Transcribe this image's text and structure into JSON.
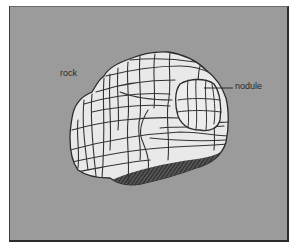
{
  "figure": {
    "background_color": "#9b9b9b",
    "rock_fill_color": "#e9e9e9",
    "outline_color": "#2b2b2b",
    "shadow_color": "#3a3a3a"
  },
  "labels": {
    "rock": "rock",
    "nodule": "nodule"
  }
}
